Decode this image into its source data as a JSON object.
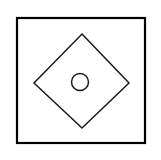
{
  "figure": {
    "title": "Square with inscribed diamond and center circle",
    "type": "line-diagram",
    "canvas": {
      "width": 161,
      "height": 160,
      "background_color": "#ffffff"
    },
    "shapes": [
      {
        "name": "outer-square",
        "kind": "rectangle",
        "label": "Outer square border",
        "x": 17,
        "y": 18,
        "width": 128,
        "height": 125,
        "fill": "#ffffff",
        "stroke": "#000000",
        "stroke_width": 2.2
      },
      {
        "name": "diamond",
        "kind": "polygon",
        "label": "Rotated square (diamond)",
        "points": "82,34 129,83 82,128 34,83",
        "vertices": {
          "top": [
            82,
            34
          ],
          "right": [
            129,
            83
          ],
          "bottom": [
            82,
            128
          ],
          "left": [
            34,
            83
          ]
        },
        "fill": "none",
        "stroke": "#1a1a1a",
        "stroke_width": 1.5
      },
      {
        "name": "center-circle",
        "kind": "circle",
        "label": "Small circle near diamond center",
        "cx": 80,
        "cy": 82,
        "r": 8.5,
        "fill": "none",
        "stroke": "#1a1a1a",
        "stroke_width": 1.5
      }
    ]
  }
}
